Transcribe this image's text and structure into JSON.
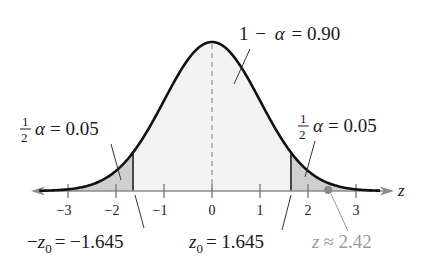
{
  "chart_data": {
    "type": "area",
    "title": "",
    "xlabel": "z",
    "ylabel": "",
    "xlim": [
      -3.7,
      3.7
    ],
    "x_ticks": [
      -3,
      -2,
      -1,
      0,
      1,
      2,
      3
    ],
    "x_tick_labels": [
      "−3",
      "−2",
      "−1",
      "0",
      "1",
      "2",
      "3"
    ],
    "distribution": {
      "name": "standard normal",
      "mean": 0,
      "sd": 1
    },
    "regions": [
      {
        "name": "left tail",
        "from": -3.7,
        "to": -1.645,
        "area": 0.05,
        "shade": "#cfcfcf"
      },
      {
        "name": "center",
        "from": -1.645,
        "to": 1.645,
        "area": 0.9,
        "shade": "#f3f3f3"
      },
      {
        "name": "right tail",
        "from": 1.645,
        "to": 3.7,
        "area": 0.05,
        "shade": "#cfcfcf"
      }
    ],
    "critical_values": [
      -1.645,
      1.645
    ],
    "marked_point": {
      "z": 2.42,
      "color": "#8a8a8a"
    },
    "annotations": [
      {
        "text": "1 − α = 0.90",
        "target": "center"
      },
      {
        "text": "½α = 0.05",
        "target": "left tail"
      },
      {
        "text": "½α = 0.05",
        "target": "right tail"
      },
      {
        "text": "−z₀ = −1.645",
        "target": "left critical value"
      },
      {
        "text": "z₀ = 1.645",
        "target": "right critical value"
      },
      {
        "text": "z ≈ 2.42",
        "target": "marked point"
      }
    ],
    "grid": false,
    "legend": null
  },
  "labels": {
    "center": {
      "lhs_1": "1",
      "minus": "−",
      "alpha": "α",
      "eq": "= 0.90"
    },
    "left_tail": {
      "num": "1",
      "den": "2",
      "alpha": "α",
      "eq": "= 0.05"
    },
    "right_tail": {
      "num": "1",
      "den": "2",
      "alpha": "α",
      "eq": "= 0.05"
    },
    "neg_z0": {
      "minus": "−",
      "z": "z",
      "sub": "0",
      "eq": "= −1.645"
    },
    "z0": {
      "z": "z",
      "sub": "0",
      "eq": "= 1.645"
    },
    "z_point": {
      "z": "z",
      "approx": "≈ 2.42"
    },
    "axis_var": "z",
    "ticks": [
      "−3",
      "−2",
      "−1",
      "0",
      "1",
      "2",
      "3"
    ]
  }
}
